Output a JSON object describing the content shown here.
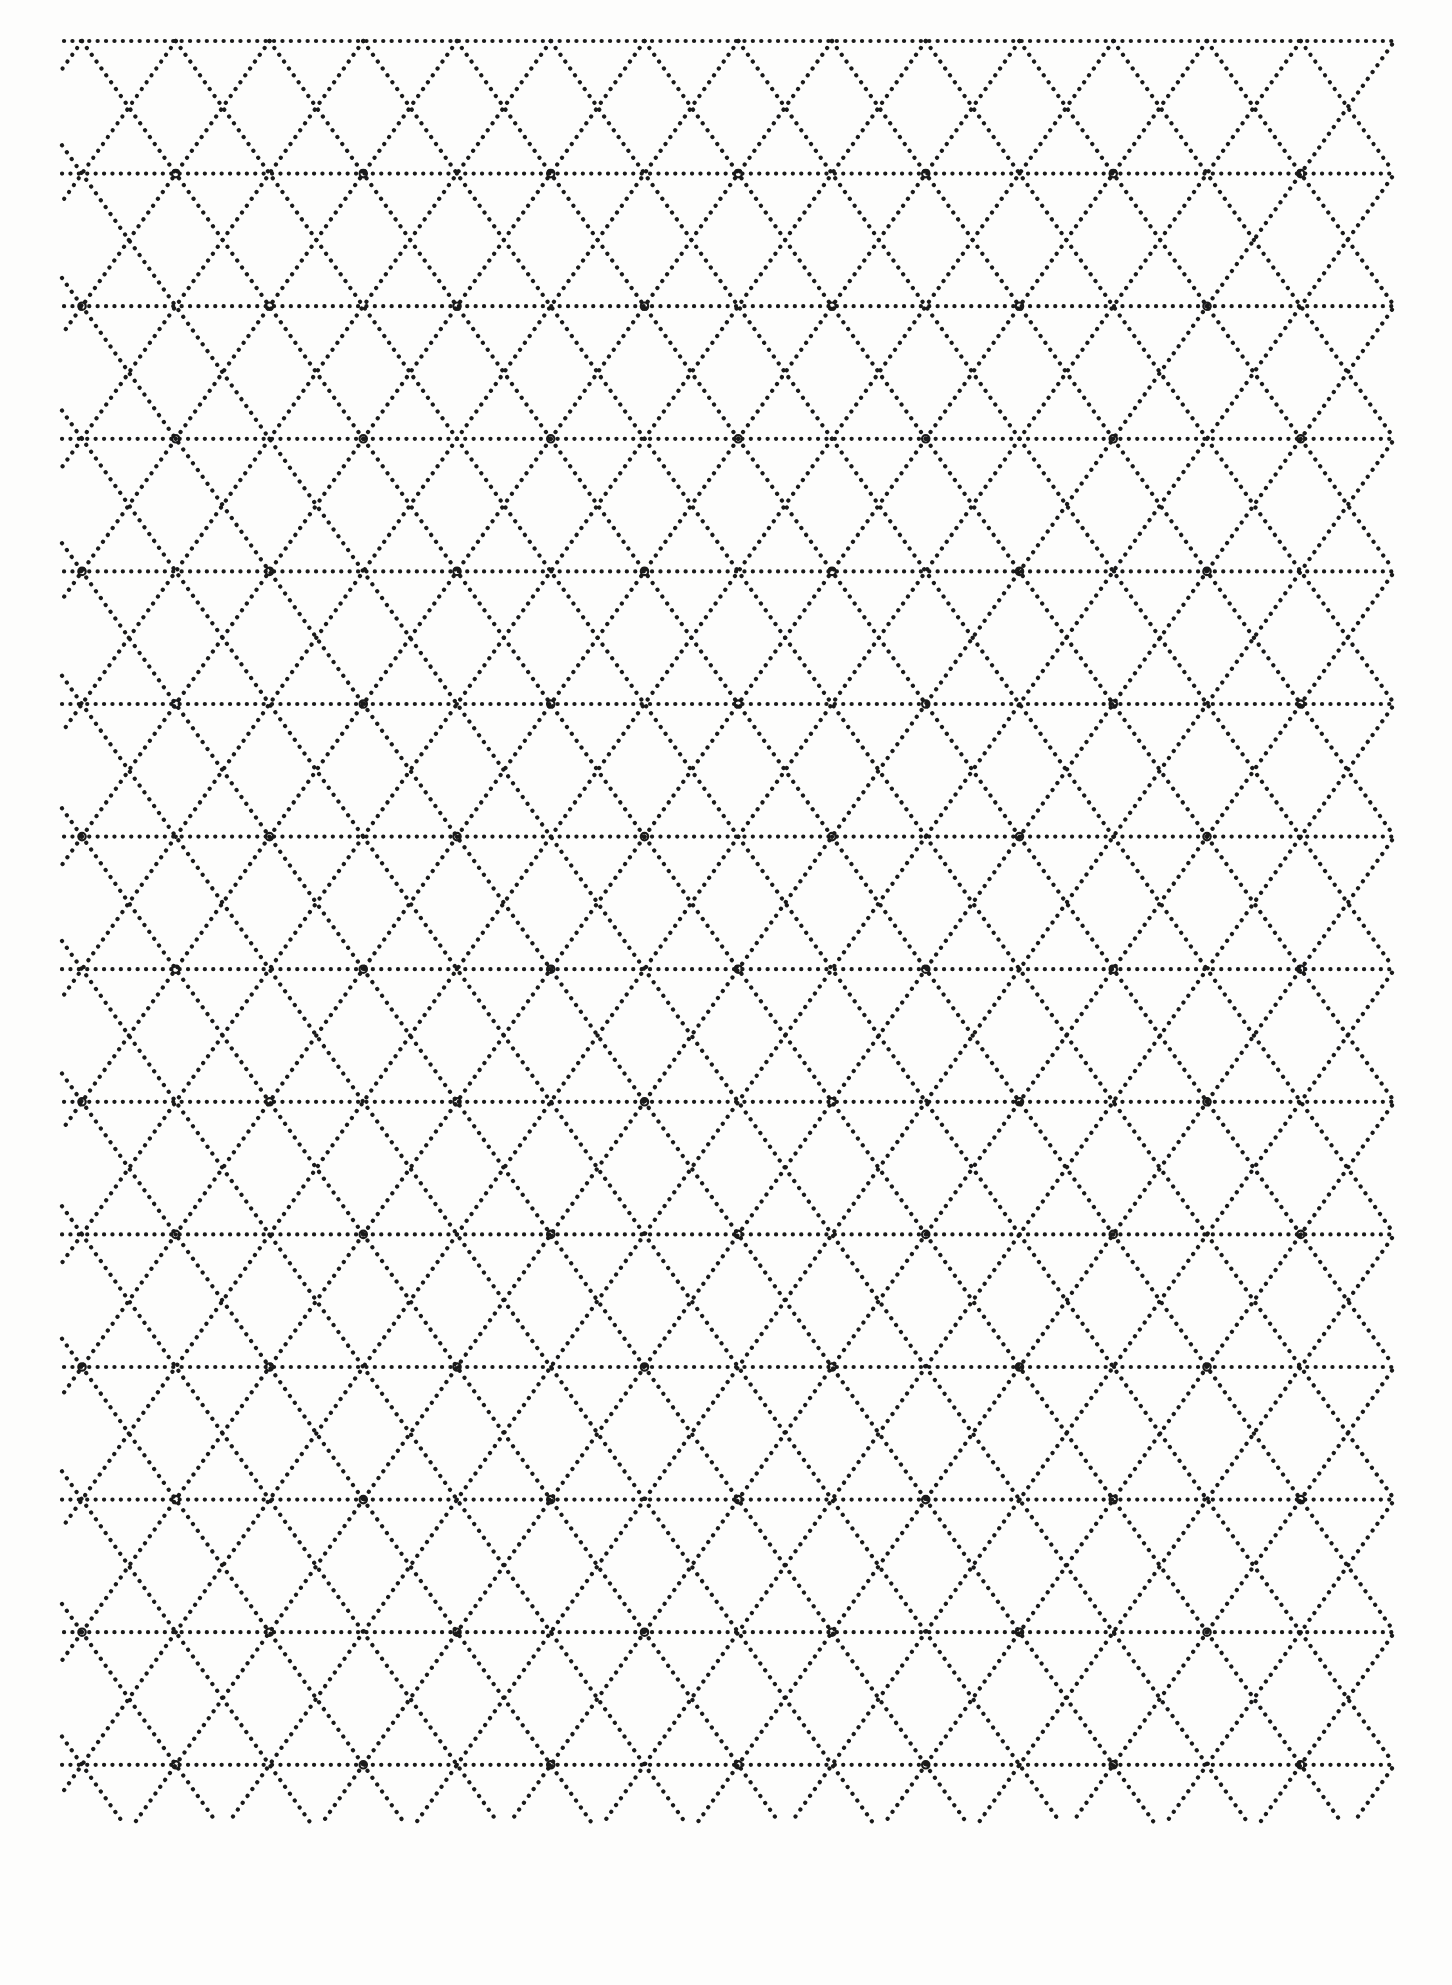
{
  "document": {
    "kind": "isometric-triangle-dot-grid-paper",
    "title": "Isometric Triangle Grid Paper",
    "page_width": 1452,
    "page_height": 1985,
    "background_color": "#fdfdfc",
    "ink_color": "#1a1a1a"
  },
  "grid": {
    "pattern": "triangular-isometric",
    "origin_x": 82,
    "origin_y": 41,
    "column_pitch": 187.5,
    "half_column_pitch": 93.75,
    "row_pitch": 132.6,
    "columns": 8,
    "rows": 15,
    "left_bound": 62,
    "right_bound": 1392,
    "top_bound": 38,
    "bottom_bound": 1822,
    "dot_radius": 2.1,
    "dot_spacing": 8.3,
    "line_style": "dotted",
    "horizontal_line_count": 15,
    "diagonal_angle_deg": 54.7
  },
  "nodes": {
    "shape": "small-open-circle",
    "outer_radius": 5.0,
    "inner_radius": 2.4,
    "stroke_width": 2.2,
    "description": "ring marker at every full lattice vertex on alternating horizontal rows",
    "rows_with_nodes": [
      1,
      2,
      3,
      4,
      5,
      6,
      7,
      8,
      9,
      10,
      11,
      12,
      13
    ],
    "columns_per_node_row": 7
  },
  "chart_data": {
    "type": "scatter",
    "xlabel": "",
    "ylabel": "",
    "xlim": [
      0,
      1452
    ],
    "ylim": [
      0,
      1985
    ],
    "grid": true,
    "legend": "none",
    "categories": [],
    "values": []
  }
}
